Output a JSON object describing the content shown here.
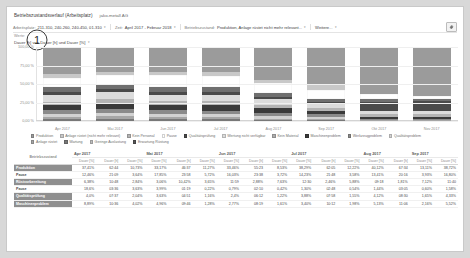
{
  "header": {
    "title": "Betriebszustandsverlauf (Arbeitsplatz)",
    "subtitle": "jako-metall AG"
  },
  "filters": [
    {
      "caption": "Arbeitsplatz:",
      "value": "211-310, 240-260, 240-450, 01-310",
      "caret": "▾"
    },
    {
      "caption": "Zeit:",
      "value": "April 2017 - Februar 2018",
      "caret": "▾"
    },
    {
      "caption": "Betriebszustand:",
      "value": "Produktion, Anlage rüstet nicht mehr relevant...",
      "caret": "▾"
    },
    {
      "caption": "",
      "value": "Weitere...",
      "caret": "▾"
    }
  ],
  "gear_icon": "gear-icon",
  "selector": {
    "label": "Werte:",
    "value": "Dauer [h] von Dauer [h] und Dauer [%]",
    "caret": "▾"
  },
  "annotation": {
    "badge": "1"
  },
  "colors": {
    "produktion": "#9b9b9b",
    "anlage_ruestet": "#c8c8c8",
    "ruestvorbereitung": "#6f6f6f",
    "pause": "#ffffff",
    "qualitaetspruefung": "#4a4a4a",
    "wertung_nicht_verfuegbar": "#dcdcdc",
    "kein_personal": "#b4b4b4",
    "maschinenproblem": "#3a3a3a",
    "werkzeugproblem": "#8a8a8a",
    "qualitaetsproblem": "#d2d2d2",
    "anlage_ruestet2": "#a6a6a6",
    "wartung": "#787878",
    "geringe_auslastung": "#bdbdbd",
    "erwartung_ruestung": "#545454"
  },
  "chart_data": {
    "type": "bar",
    "title": "Betriebszustandsverlauf (Arbeitsplatz)",
    "xlabel": "",
    "ylabel": "",
    "ylim": [
      0,
      100
    ],
    "ytick_labels": [
      "100,00 %",
      "75,00 %",
      "50,00 %",
      "25,00 %",
      "0,00 %"
    ],
    "ytick_values": [
      100,
      75,
      50,
      25,
      0
    ],
    "grid": true,
    "legend_position": "bottom",
    "stacked": true,
    "categories": [
      "Apr 2017",
      "Mai 2017",
      "Jun 2017",
      "Jul 2017",
      "Aug 2017",
      "Sep 2017",
      "Okt 2017",
      "Nov 2017"
    ],
    "series": [
      {
        "name": "Produktion",
        "color": "#9b9b9b",
        "values": [
          37.0,
          33.2,
          33.5,
          34.0,
          44.0,
          52.0,
          63.0,
          66.0
        ]
      },
      {
        "name": "Anlage rüstet (nicht mehr relevant)",
        "color": "#c8c8c8",
        "values": [
          5.0,
          4.5,
          4.0,
          5.0,
          5.0,
          6.5,
          1.0,
          0.5
        ]
      },
      {
        "name": "Pause",
        "color": "#ffffff",
        "values": [
          12.5,
          13.0,
          16.5,
          15.5,
          13.0,
          12.0,
          6.0,
          3.0
        ]
      },
      {
        "name": "Rüstvorbereitung",
        "color": "#6f6f6f",
        "values": [
          6.3,
          6.0,
          7.5,
          6.0,
          5.0,
          4.0,
          4.0,
          3.5
        ]
      },
      {
        "name": "Qualitätsprüfung",
        "color": "#4a4a4a",
        "values": [
          4.0,
          4.2,
          3.0,
          4.0,
          4.0,
          3.0,
          12.0,
          13.0
        ]
      },
      {
        "name": "Wertung nicht verfügbar",
        "color": "#dcdcdc",
        "values": [
          8.9,
          9.0,
          8.0,
          8.5,
          7.0,
          6.0,
          5.0,
          5.0
        ]
      },
      {
        "name": "Kein Personal",
        "color": "#b4b4b4",
        "values": [
          5.0,
          6.0,
          5.5,
          6.0,
          5.0,
          4.0,
          3.0,
          3.0
        ]
      },
      {
        "name": "Maschinenproblem",
        "color": "#3a3a3a",
        "values": [
          7.0,
          8.0,
          7.0,
          7.0,
          6.0,
          4.5,
          3.0,
          3.0
        ]
      },
      {
        "name": "Werkzeugproblem",
        "color": "#8a8a8a",
        "values": [
          4.3,
          5.1,
          5.0,
          4.0,
          4.0,
          3.0,
          1.0,
          1.0
        ]
      },
      {
        "name": "Qualitätsproblem",
        "color": "#d2d2d2",
        "values": [
          5.0,
          5.0,
          5.0,
          5.0,
          4.0,
          3.0,
          1.0,
          1.0
        ]
      },
      {
        "name": "Anlage rüstet",
        "color": "#a6a6a6",
        "values": [
          3.0,
          3.0,
          3.0,
          3.0,
          2.0,
          2.0,
          0.5,
          0.5
        ]
      },
      {
        "name": "Wartung",
        "color": "#787878",
        "values": [
          2.0,
          3.0,
          2.0,
          2.0,
          1.0,
          1.0,
          0.3,
          0.3
        ]
      }
    ]
  },
  "legend": [
    {
      "label": "Produktion",
      "color": "#9b9b9b"
    },
    {
      "label": "Anlage rüstet (nicht mehr relevant)",
      "color": "#c8c8c8"
    },
    {
      "label": "Kein Personal",
      "color": "#b4b4b4"
    },
    {
      "label": "Pause",
      "color": "#ffffff"
    },
    {
      "label": "Qualitätsprüfung",
      "color": "#4a4a4a"
    },
    {
      "label": "Wertung nicht verfügbar",
      "color": "#dcdcdc"
    },
    {
      "label": "Kein Material",
      "color": "#aeaeae"
    },
    {
      "label": "Maschinenproblem",
      "color": "#3a3a3a"
    },
    {
      "label": "Werkzeugproblem",
      "color": "#8a8a8a"
    },
    {
      "label": "Qualitätsproblem",
      "color": "#d2d2d2"
    },
    {
      "label": "Anlage rüstet",
      "color": "#a6a6a6"
    },
    {
      "label": "Wartung",
      "color": "#787878"
    },
    {
      "label": "Geringe Auslastung",
      "color": "#bdbdbd"
    },
    {
      "label": "Erwartung Rüstung",
      "color": "#545454"
    }
  ],
  "table": {
    "corner_label": "Betriebszustand",
    "month_groups": [
      "Apr 2017",
      "Mai 2017",
      "Jun 2017",
      "Jul 2017",
      "Aug 2017",
      "Sep 2017"
    ],
    "sub_headers": [
      "Dauer [%]",
      "Dauer [h]",
      "Dauer [%]",
      "Dauer [%]",
      "Dauer [h]",
      "Dauer [%]",
      "Dauer [%]",
      "Dauer [h]",
      "Dauer [%]",
      "Dauer [%]",
      "Dauer [h]",
      "Dauer [%]",
      "Dauer [%]",
      "Dauer [h]",
      "Dauer [%]",
      "Dauer [%]",
      "Dauer [h]",
      "Dauer [%]"
    ],
    "rows": [
      {
        "label": "Produktion",
        "highlight": true,
        "cells": [
          "37,41%",
          "62:44",
          "10,73%",
          "33,17%",
          "46:37",
          "11,27%",
          "33,46%",
          "55:23",
          "8,53%",
          "38,29%",
          "62:05",
          "12,22%",
          "40,12%",
          "67:34",
          "13,11%",
          "38,72%"
        ]
      },
      {
        "label": "Pause",
        "highlight": false,
        "cells": [
          "12,46%",
          "21:09",
          "3,64%",
          "17,85%",
          "23:58",
          "5,72%",
          "16,03%",
          "23:38",
          "3,72%",
          "14,23%",
          "21:48",
          "3,58%",
          "13,41%",
          "20:16",
          "3,93%",
          "16,80%"
        ]
      },
      {
        "label": "Rüstvorbereitung",
        "highlight": true,
        "cells": [
          "6,38%",
          "10:48",
          "2,84%",
          "3,06%",
          "10,42%",
          "3,65%",
          "11:59",
          "2,88%",
          "7,63%",
          "12:30",
          "2,46%",
          "5,88%",
          "09:18",
          "1,81%",
          "7,12%",
          "11:40"
        ]
      },
      {
        "label": "Pause",
        "highlight": false,
        "cells": [
          "18,6%",
          "03:36",
          "3,63%",
          "3,99%",
          "01:19",
          "0,22%",
          "0,79%",
          "02:10",
          "0,42%",
          "1,30%",
          "02:48",
          "0,54%",
          "1,44%",
          "03:05",
          "0,60%",
          "1,58%"
        ]
      },
      {
        "label": "Qualitätsprüfung",
        "highlight": true,
        "cells": [
          "4,0%",
          "07:37",
          "2,04%",
          "3,63%",
          "04:51",
          "1,16%",
          "2,4%",
          "06:12",
          "1,22%",
          "3,88%",
          "07:58",
          "1,55%",
          "4,12%",
          "08:30",
          "1,65%",
          "4,33%"
        ]
      },
      {
        "label": "Maschinenproblem",
        "highlight": true,
        "cells": [
          "8,89%",
          "10:36",
          "4,02%",
          "4,96%",
          "09:46",
          "1,28%",
          "2,77%",
          "08:19",
          "1,61%",
          "3,40%",
          "10:12",
          "1,98%",
          "5,13%",
          "11:06",
          "2,16%",
          "5,52%"
        ]
      }
    ]
  }
}
